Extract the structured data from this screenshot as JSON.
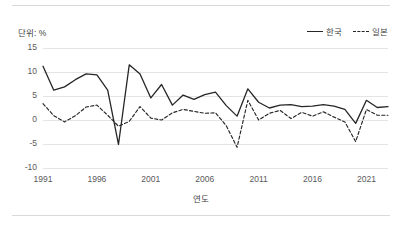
{
  "unit_label": "단위: %",
  "legend": {
    "position": "top-right",
    "entries": [
      {
        "label": "한국",
        "style": "solid"
      },
      {
        "label": "일본",
        "style": "dashed"
      }
    ]
  },
  "axes": {
    "y_ticks": [
      "15",
      "10",
      "5",
      "0",
      "-5",
      "-10"
    ],
    "x_ticks": [
      "1991",
      "1996",
      "2001",
      "2006",
      "2011",
      "2016",
      "2021"
    ],
    "xlabel": "연도",
    "ylabel": ""
  },
  "colors": {
    "series_line": "#262626",
    "gridline": "#e4e4e4",
    "frame": "#d9d9d9",
    "tick_text": "#59595b",
    "label_text": "#3f3f3f",
    "background": "#ffffff"
  },
  "chart_data": {
    "type": "line",
    "title": "",
    "subtitle": "",
    "xlabel": "연도",
    "ylabel": "",
    "unit": "%",
    "grid": true,
    "legend_position": "top-right",
    "xlim": [
      1991,
      2023
    ],
    "ylim": [
      -10,
      15
    ],
    "x": [
      1991,
      1992,
      1993,
      1994,
      1995,
      1996,
      1997,
      1998,
      1999,
      2000,
      2001,
      2002,
      2003,
      2004,
      2005,
      2006,
      2007,
      2008,
      2009,
      2010,
      2011,
      2012,
      2013,
      2014,
      2015,
      2016,
      2017,
      2018,
      2019,
      2020,
      2021,
      2022,
      2023
    ],
    "series": [
      {
        "name": "한국",
        "style": "solid",
        "values": [
          11.2,
          6.2,
          6.9,
          8.4,
          9.6,
          9.4,
          6.2,
          -5.1,
          11.5,
          9.6,
          4.6,
          7.4,
          3.1,
          5.2,
          4.3,
          5.3,
          5.8,
          3.0,
          0.8,
          6.5,
          3.7,
          2.5,
          3.1,
          3.2,
          2.8,
          2.9,
          3.2,
          2.9,
          2.2,
          -0.7,
          4.1,
          2.6,
          2.8
        ]
      },
      {
        "name": "일본",
        "style": "dashed",
        "values": [
          3.4,
          0.9,
          -0.4,
          0.9,
          2.7,
          3.1,
          1.0,
          -1.3,
          -0.3,
          2.8,
          0.4,
          0.0,
          1.5,
          2.2,
          1.8,
          1.4,
          1.5,
          -1.2,
          -5.7,
          4.1,
          0.0,
          1.4,
          2.0,
          0.3,
          1.6,
          0.8,
          1.7,
          0.6,
          -0.4,
          -4.5,
          2.2,
          1.0,
          1.0
        ]
      }
    ]
  }
}
